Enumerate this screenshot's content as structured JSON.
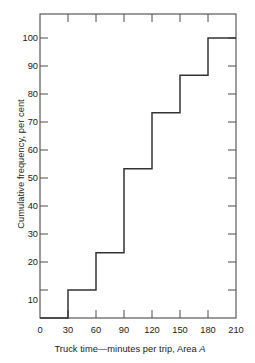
{
  "chart_data": {
    "type": "line",
    "subtype": "step-cumulative-frequency",
    "title": "",
    "xlabel_parts": {
      "main": "Truck time—minutes per trip, Area ",
      "italic": "A"
    },
    "xlabel": "Truck time—minutes per trip, Area A",
    "ylabel": "Cumulative frequency, per cent",
    "xlim": [
      0,
      210
    ],
    "ylim": [
      0,
      110
    ],
    "xticks": [
      0,
      30,
      60,
      90,
      120,
      150,
      180,
      210
    ],
    "yticks": [
      10,
      20,
      30,
      40,
      50,
      60,
      70,
      80,
      90,
      100
    ],
    "xtick_labels": [
      "0",
      "30",
      "60",
      "90",
      "120",
      "150",
      "180",
      "210"
    ],
    "ytick_labels": [
      "10",
      "20",
      "30",
      "40",
      "50",
      "60",
      "70",
      "80",
      "90",
      "100"
    ],
    "grid": false,
    "legend": "none",
    "bin_edges": [
      0,
      30,
      60,
      90,
      120,
      150,
      180,
      210
    ],
    "step_levels": [
      0,
      10,
      23.3,
      53.3,
      73.3,
      86.7,
      100
    ],
    "step_points": [
      {
        "x": 0,
        "y": 0
      },
      {
        "x": 30,
        "y": 0
      },
      {
        "x": 30,
        "y": 10
      },
      {
        "x": 60,
        "y": 10
      },
      {
        "x": 60,
        "y": 23.3
      },
      {
        "x": 90,
        "y": 23.3
      },
      {
        "x": 90,
        "y": 53.3
      },
      {
        "x": 120,
        "y": 53.3
      },
      {
        "x": 120,
        "y": 73.3
      },
      {
        "x": 150,
        "y": 73.3
      },
      {
        "x": 150,
        "y": 86.7
      },
      {
        "x": 180,
        "y": 86.7
      },
      {
        "x": 180,
        "y": 100
      },
      {
        "x": 210,
        "y": 100
      }
    ],
    "series": [
      {
        "name": "Cumulative frequency",
        "categories": [
          "0-30",
          "30-60",
          "60-90",
          "90-120",
          "120-150",
          "150-180",
          "180-210"
        ],
        "values": [
          0,
          10,
          23.3,
          53.3,
          73.3,
          86.7,
          100
        ]
      }
    ],
    "line_color": "#333333",
    "frame_color": "#444444",
    "background": "#ffffff"
  }
}
